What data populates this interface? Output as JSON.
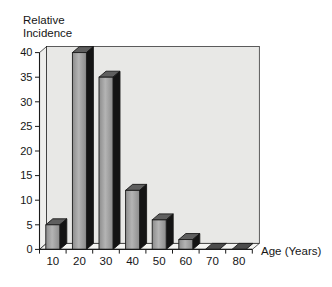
{
  "figure": {
    "y_axis_title_line1": "Relative",
    "y_axis_title_line2": "Incidence",
    "x_axis_title": "Age (Years)"
  },
  "chart_data": {
    "type": "bar",
    "style": "3d-column",
    "title": "",
    "xlabel": "Age (Years)",
    "ylabel": "Relative Incidence",
    "categories": [
      "10",
      "20",
      "30",
      "40",
      "50",
      "60",
      "70",
      "80"
    ],
    "values": [
      5,
      40,
      35,
      12,
      6,
      2,
      0,
      0
    ],
    "y_ticks": [
      0,
      5,
      10,
      15,
      20,
      25,
      30,
      35,
      40
    ],
    "ylim": [
      0,
      40
    ],
    "grid": false,
    "legend": false,
    "colors": {
      "wall": "#e8e8e6",
      "wall_side": "#eeeeec",
      "floor": "#f4f4f2",
      "bar_front_dark": "#8c8c8c",
      "bar_front_light": "#b4b4b4",
      "bar_top": "#5f5f5f",
      "bar_side": "#141414",
      "bar_zero": "#4c4c4c",
      "outline": "#1a1a1a",
      "text": "#161616"
    }
  }
}
